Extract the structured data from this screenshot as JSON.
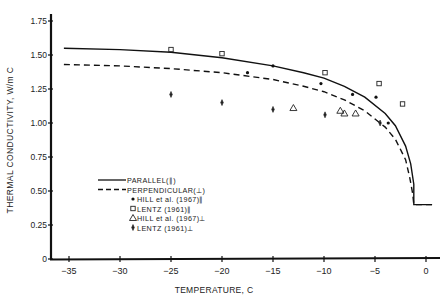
{
  "chart_data": {
    "type": "line",
    "title": "",
    "xlabel": "TEMPERATURE, C",
    "ylabel": "THERMAL CONDUCTIVITY, W/m C",
    "xlim": [
      -36.5,
      1.5
    ],
    "ylim": [
      0,
      1.8
    ],
    "x_ticks": [
      -35,
      -30,
      -25,
      -20,
      -15,
      -10,
      -5,
      0
    ],
    "x_tick_labels": [
      "−35",
      "−30",
      "−25",
      "−20",
      "−15",
      "−10",
      "−5",
      "0"
    ],
    "y_ticks": [
      0,
      0.25,
      0.5,
      0.75,
      1.0,
      1.25,
      1.5,
      1.75
    ],
    "y_tick_labels": [
      "0",
      "0.25",
      "0.50",
      "0.75",
      "1.00",
      "1.25",
      "1.50",
      "1.75"
    ],
    "grid": false,
    "legend_position": "center-left",
    "series": [
      {
        "name": "PARALLEL(∥)",
        "kind": "line",
        "style": "solid",
        "x": [
          -35.5,
          -30,
          -25,
          -20,
          -15,
          -12,
          -10,
          -8,
          -6,
          -4,
          -3,
          -2,
          -1.5,
          -1.2,
          -1.2,
          0.6
        ],
        "y": [
          1.55,
          1.54,
          1.52,
          1.48,
          1.42,
          1.37,
          1.33,
          1.27,
          1.19,
          1.07,
          0.98,
          0.83,
          0.7,
          0.55,
          0.4,
          0.4
        ]
      },
      {
        "name": "PERPENDICULAR(⊥)",
        "kind": "line",
        "style": "dashed",
        "x": [
          -35.5,
          -30,
          -25,
          -20,
          -15,
          -12,
          -10,
          -8,
          -6,
          -4,
          -3,
          -2,
          -1.6,
          -1.3,
          -1.2,
          0.6
        ],
        "y": [
          1.43,
          1.42,
          1.4,
          1.37,
          1.32,
          1.27,
          1.23,
          1.17,
          1.09,
          0.97,
          0.88,
          0.73,
          0.6,
          0.48,
          0.4,
          0.4
        ]
      },
      {
        "name": "HILL et al. (1967)∥",
        "kind": "scatter",
        "marker": "dot",
        "x": [
          -15,
          -17.5,
          -10.3,
          -7.2,
          -4.9,
          -3.7
        ],
        "y": [
          1.42,
          1.37,
          1.29,
          1.21,
          1.19,
          1.0
        ]
      },
      {
        "name": "LENTZ (1961)∥",
        "kind": "scatter",
        "marker": "square",
        "x": [
          -25,
          -20,
          -9.9,
          -4.6,
          -2.3
        ],
        "y": [
          1.54,
          1.51,
          1.37,
          1.29,
          1.14
        ]
      },
      {
        "name": "HILL et al. (1967)⊥",
        "kind": "scatter",
        "marker": "triangle",
        "x": [
          -13,
          -8.4,
          -8,
          -6.9
        ],
        "y": [
          1.11,
          1.09,
          1.07,
          1.07
        ]
      },
      {
        "name": "LENTZ (1961)⊥",
        "kind": "scatter",
        "marker": "diamond",
        "x": [
          -25,
          -20,
          -15,
          -9.9,
          -4.5
        ],
        "y": [
          1.21,
          1.15,
          1.1,
          1.06,
          1.0
        ]
      }
    ]
  },
  "legend": {
    "items": [
      {
        "label": "PARALLEL(∥)",
        "marker": "solid-line"
      },
      {
        "label": "PERPENDICULAR(⊥)",
        "marker": "dashed-line"
      },
      {
        "label": "HILL et al. (1967)∥",
        "marker": "dot"
      },
      {
        "label": "LENTZ (1961)∥",
        "marker": "square"
      },
      {
        "label": "HILL et al. (1967)⊥",
        "marker": "triangle"
      },
      {
        "label": "LENTZ (1961)⊥",
        "marker": "diamond"
      }
    ]
  },
  "axes": {
    "xlabel": "TEMPERATURE, C",
    "ylabel": "THERMAL CONDUCTIVITY, W/m C"
  }
}
